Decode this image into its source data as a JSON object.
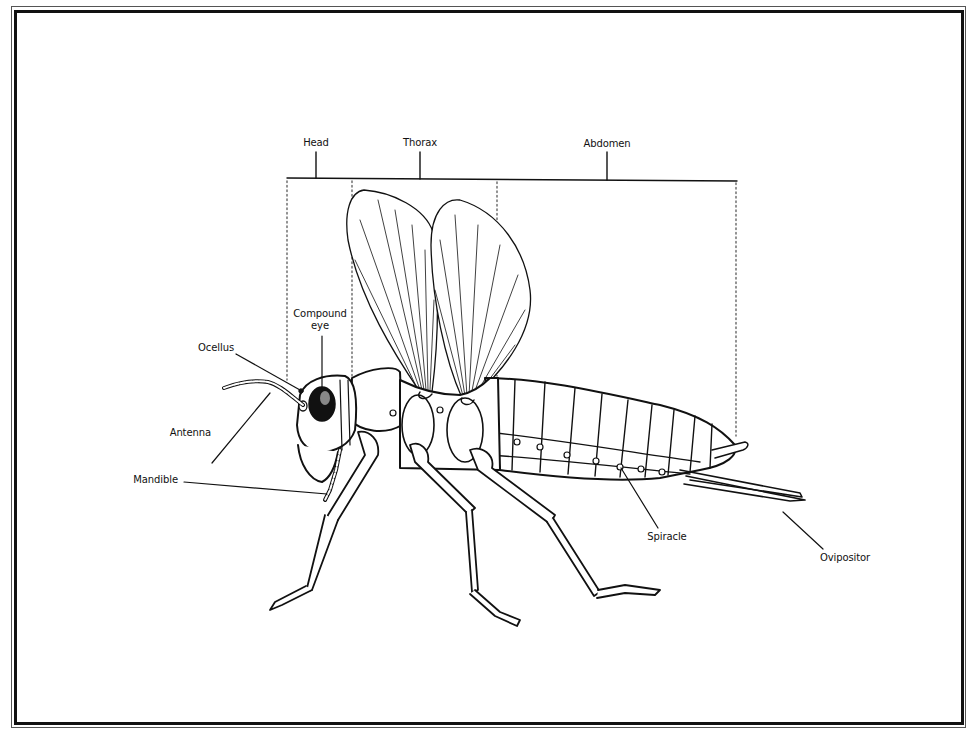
{
  "diagram": {
    "region_labels": [
      {
        "id": "head",
        "label": "Head"
      },
      {
        "id": "thorax",
        "label": "Thorax"
      },
      {
        "id": "abdomen",
        "label": "Abdomen"
      }
    ],
    "part_labels": {
      "compound_eye": {
        "line1": "Compound",
        "line2": "eye"
      },
      "ocellus": "Ocellus",
      "antenna": "Antenna",
      "mandible": "Mandible",
      "spiracle": "Spiracle",
      "ovipositor": "Ovipositor"
    },
    "colors": {
      "ink": "#111111",
      "background": "#ffffff",
      "guide_dots": "#777777"
    }
  }
}
